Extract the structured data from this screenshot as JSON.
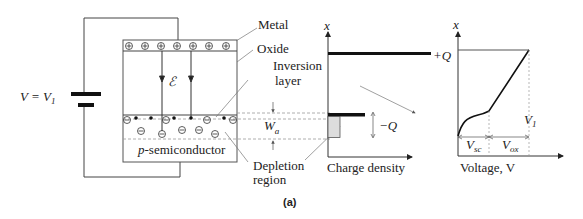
{
  "figure": {
    "caption": "(a)",
    "mos_structure": {
      "battery_label": "V = V",
      "battery_label_sub": "1",
      "field_label": "ℰ",
      "substrate_label": "p-semiconductor",
      "substrate_label_italic": "p",
      "substrate_label_rest": "-semiconductor",
      "charges": {
        "metal": "+",
        "semiconductor": "−"
      }
    },
    "annotations": {
      "metal": "Metal",
      "oxide": "Oxide",
      "inversion_line1": "Inversion",
      "inversion_line2": "layer",
      "depletion_line1": "Depletion",
      "depletion_line2": "region",
      "width_label": "W",
      "width_sub": "a"
    },
    "charge_plot": {
      "y_axis": "x",
      "x_axis_label": "Charge density",
      "pos_charge": "+Q",
      "neg_charge": "−Q"
    },
    "voltage_plot": {
      "y_axis": "x",
      "x_axis_label": "Voltage, V",
      "v1_label": "V",
      "v1_sub": "1",
      "vsc_label": "V",
      "vsc_sub": "sc",
      "vox_label": "V",
      "vox_sub": "ox"
    }
  }
}
